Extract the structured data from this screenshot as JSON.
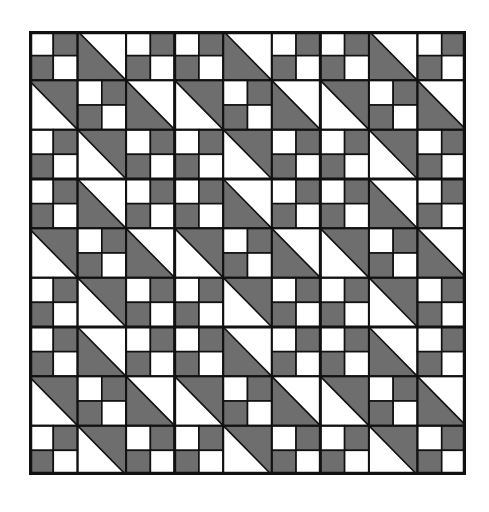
{
  "quilt": {
    "title": "",
    "blocks_x": 3,
    "blocks_y": 3,
    "cells_per_block": 3,
    "colors": {
      "dark": "#6e6e6e",
      "light": "#ffffff",
      "line": "#111111"
    },
    "block_pattern": [
      [
        {
          "type": "four-patch",
          "squares": [
            "light",
            "dark",
            "dark",
            "light"
          ]
        },
        {
          "type": "half-square-triangle",
          "diagonal": "tl-br",
          "dark_side": "lower-left"
        },
        {
          "type": "four-patch",
          "squares": [
            "light",
            "dark",
            "dark",
            "light"
          ]
        }
      ],
      [
        {
          "type": "half-square-triangle",
          "diagonal": "tl-br",
          "dark_side": "upper-right"
        },
        {
          "type": "four-patch",
          "squares": [
            "light",
            "dark",
            "dark",
            "light"
          ]
        },
        {
          "type": "half-square-triangle",
          "diagonal": "tl-br",
          "dark_side": "lower-left"
        }
      ],
      [
        {
          "type": "four-patch",
          "squares": [
            "light",
            "dark",
            "dark",
            "light"
          ]
        },
        {
          "type": "half-square-triangle",
          "diagonal": "tl-br",
          "dark_side": "upper-right"
        },
        {
          "type": "four-patch",
          "squares": [
            "light",
            "dark",
            "dark",
            "light"
          ]
        }
      ]
    ]
  }
}
